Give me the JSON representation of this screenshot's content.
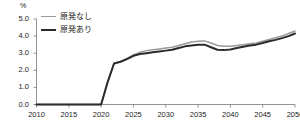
{
  "chart_data": {
    "type": "line",
    "title": "",
    "subtitle": "",
    "xlabel": "",
    "ylabel": "",
    "unit_label": "%",
    "xlim": [
      2010,
      2050
    ],
    "ylim": [
      0.0,
      5.0
    ],
    "grid": false,
    "legend_position": "top-left",
    "x_ticks": [
      "2010",
      "2015",
      "2020",
      "2025",
      "2030",
      "2035",
      "2040",
      "2045",
      "2050"
    ],
    "x_tick_values": [
      2010,
      2015,
      2020,
      2025,
      2030,
      2035,
      2040,
      2045,
      2050
    ],
    "y_ticks": [
      "0.0",
      "1.0",
      "2.0",
      "3.0",
      "4.0",
      "5.0"
    ],
    "y_tick_values": [
      0.0,
      1.0,
      2.0,
      3.0,
      4.0,
      5.0
    ],
    "x": [
      2010,
      2011,
      2012,
      2013,
      2014,
      2015,
      2016,
      2017,
      2018,
      2019,
      2020,
      2021,
      2022,
      2023,
      2024,
      2025,
      2026,
      2027,
      2028,
      2029,
      2030,
      2031,
      2032,
      2033,
      2034,
      2035,
      2036,
      2037,
      2038,
      2039,
      2040,
      2041,
      2042,
      2043,
      2044,
      2045,
      2046,
      2047,
      2048,
      2049,
      2050
    ],
    "series": [
      {
        "name": "原発なし",
        "color": "#9a9a9a",
        "width": 1.5,
        "values": [
          0.0,
          0.0,
          0.0,
          0.0,
          0.0,
          0.0,
          0.0,
          0.0,
          0.0,
          0.0,
          0.0,
          1.3,
          2.4,
          2.5,
          2.7,
          2.9,
          3.05,
          3.15,
          3.2,
          3.25,
          3.3,
          3.35,
          3.45,
          3.55,
          3.65,
          3.7,
          3.72,
          3.6,
          3.45,
          3.4,
          3.4,
          3.45,
          3.5,
          3.55,
          3.6,
          3.7,
          3.8,
          3.9,
          4.0,
          4.15,
          4.3
        ]
      },
      {
        "name": "原発あり",
        "color": "#2b2b2b",
        "width": 2.0,
        "values": [
          0.0,
          0.0,
          0.0,
          0.0,
          0.0,
          0.0,
          0.0,
          0.0,
          0.0,
          0.0,
          0.0,
          1.3,
          2.4,
          2.5,
          2.65,
          2.85,
          2.95,
          3.0,
          3.05,
          3.1,
          3.15,
          3.2,
          3.3,
          3.4,
          3.45,
          3.5,
          3.5,
          3.35,
          3.2,
          3.18,
          3.22,
          3.3,
          3.38,
          3.45,
          3.5,
          3.6,
          3.7,
          3.78,
          3.88,
          4.0,
          4.15
        ]
      }
    ]
  }
}
